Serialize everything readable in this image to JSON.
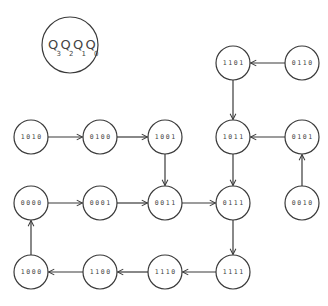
{
  "diagram": {
    "legend": {
      "letter": "Q",
      "subscripts": [
        "3",
        "2",
        "1",
        "0"
      ],
      "cx": 70,
      "cy": 45,
      "r": 28
    },
    "node_radius": 17,
    "nodes": [
      {
        "id": "1101",
        "label": "1101",
        "cx": 233,
        "cy": 63
      },
      {
        "id": "0110",
        "label": "0110",
        "cx": 302,
        "cy": 63
      },
      {
        "id": "1010",
        "label": "1010",
        "cx": 31,
        "cy": 137
      },
      {
        "id": "0100",
        "label": "0100",
        "cx": 100,
        "cy": 137
      },
      {
        "id": "1001",
        "label": "1001",
        "cx": 165,
        "cy": 137
      },
      {
        "id": "1011",
        "label": "1011",
        "cx": 233,
        "cy": 137
      },
      {
        "id": "0101",
        "label": "0101",
        "cx": 302,
        "cy": 137
      },
      {
        "id": "0000",
        "label": "0000",
        "cx": 31,
        "cy": 203
      },
      {
        "id": "0001",
        "label": "0001",
        "cx": 100,
        "cy": 203
      },
      {
        "id": "0011",
        "label": "0011",
        "cx": 165,
        "cy": 203
      },
      {
        "id": "0111",
        "label": "0111",
        "cx": 233,
        "cy": 203
      },
      {
        "id": "0010",
        "label": "0010",
        "cx": 302,
        "cy": 203
      },
      {
        "id": "1000",
        "label": "1000",
        "cx": 31,
        "cy": 272
      },
      {
        "id": "1100",
        "label": "1100",
        "cx": 100,
        "cy": 272
      },
      {
        "id": "1110",
        "label": "1110",
        "cx": 165,
        "cy": 272
      },
      {
        "id": "1111",
        "label": "1111",
        "cx": 233,
        "cy": 272
      }
    ],
    "edges": [
      {
        "from": "0110",
        "to": "1101"
      },
      {
        "from": "1101",
        "to": "1011"
      },
      {
        "from": "1010",
        "to": "0100"
      },
      {
        "from": "0100",
        "to": "1001"
      },
      {
        "from": "1001",
        "to": "0011"
      },
      {
        "from": "0101",
        "to": "1011"
      },
      {
        "from": "1011",
        "to": "0111"
      },
      {
        "from": "0010",
        "to": "0101"
      },
      {
        "from": "0000",
        "to": "0001"
      },
      {
        "from": "0001",
        "to": "0011"
      },
      {
        "from": "0011",
        "to": "0111"
      },
      {
        "from": "0111",
        "to": "1111"
      },
      {
        "from": "1111",
        "to": "1110"
      },
      {
        "from": "1110",
        "to": "1100"
      },
      {
        "from": "1100",
        "to": "1000"
      },
      {
        "from": "1000",
        "to": "0000"
      }
    ],
    "colors": {
      "stroke": "#3a3a3a",
      "text": "#444444",
      "background": "#ffffff"
    }
  }
}
